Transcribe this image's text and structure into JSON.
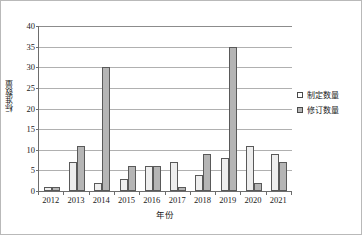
{
  "chart_data": {
    "type": "bar",
    "title": "",
    "xlabel": "年份",
    "ylabel": "标准数量",
    "categories": [
      "2012",
      "2013",
      "2014",
      "2015",
      "2016",
      "2017",
      "2018",
      "2019",
      "2020",
      "2021"
    ],
    "series": [
      {
        "name": "制定数量",
        "color": "#eeeeee",
        "values": [
          1,
          7,
          2,
          3,
          6,
          7,
          4,
          8,
          11,
          9
        ]
      },
      {
        "name": "修订数量",
        "color": "#b5b5b5",
        "values": [
          1,
          11,
          30,
          6,
          6,
          1,
          9,
          35,
          2,
          7
        ]
      }
    ],
    "ylim": [
      0,
      40
    ],
    "ytick_labels": [
      "0",
      "5",
      "10",
      "15",
      "20",
      "25",
      "30",
      "35",
      "40"
    ],
    "ytick_values": [
      0,
      5,
      10,
      15,
      20,
      25,
      30,
      35,
      40
    ],
    "grid": "horizontal",
    "legend_position": "right"
  },
  "legend": {
    "items": [
      {
        "label": "制定数量"
      },
      {
        "label": "修订数量"
      }
    ]
  }
}
